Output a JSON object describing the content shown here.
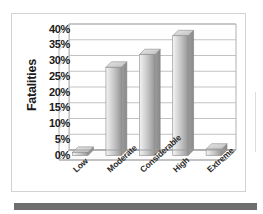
{
  "chart_data": {
    "type": "bar",
    "title": "",
    "subtitle": "",
    "xlabel": "",
    "ylabel": "Fatalities",
    "categories": [
      "Low",
      "Moderate",
      "Considerable",
      "High",
      "Extreme"
    ],
    "values": [
      1,
      28,
      32,
      38,
      2
    ],
    "value_labels": [
      "1%",
      "28%",
      "32%",
      "38%",
      "2%"
    ],
    "ylim": [
      0,
      40
    ],
    "ytick_values": [
      0,
      5,
      10,
      15,
      20,
      25,
      30,
      35,
      40
    ],
    "ytick_labels": [
      "0%",
      "5%",
      "10%",
      "15%",
      "20%",
      "25%",
      "30%",
      "35%",
      "40%"
    ],
    "grid": true,
    "grid_axis": "y",
    "legend": false,
    "legend_position": "none",
    "style": "3d-column",
    "series": [
      {
        "name": "Fatalities",
        "values": [
          1,
          28,
          32,
          38,
          2
        ]
      }
    ],
    "annotations": []
  },
  "colors": {
    "bar_fill_light": "#f2f2f2",
    "bar_fill_mid": "#c9c9c9",
    "bar_fill_dark": "#9a9a9a",
    "bar_top_face": "#d8d8d8",
    "bar_side_face": "#8f8f8f",
    "grid_line": "#b4b4b4",
    "axis_line": "#9c9c9c",
    "plot_background": "#ffffff",
    "frame_border": "#d2d2d2",
    "bottom_band": "#6e6e6e",
    "text": "#1a1a1a"
  }
}
